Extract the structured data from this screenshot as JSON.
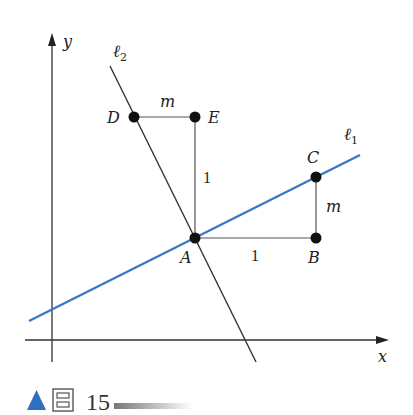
{
  "figure": {
    "caption": {
      "marker": "▲",
      "char": "图",
      "number": "15",
      "accent_color": "#2f6fc0"
    },
    "axes": {
      "x_label": "x",
      "y_label": "y",
      "color": "#333333"
    },
    "lines": [
      {
        "id": "l1",
        "label": "ℓ",
        "subscript": "1",
        "color": "#3a78c4",
        "description": "slope m"
      },
      {
        "id": "l2",
        "label": "ℓ",
        "subscript": "2",
        "color": "#333333",
        "description": "perpendicular, slope -1/m"
      }
    ],
    "points": [
      {
        "name": "A",
        "label": "A"
      },
      {
        "name": "B",
        "label": "B"
      },
      {
        "name": "C",
        "label": "C"
      },
      {
        "name": "D",
        "label": "D"
      },
      {
        "name": "E",
        "label": "E"
      }
    ],
    "segments": {
      "AB_label": "1",
      "BC_label": "m",
      "AE_label": "1",
      "DE_label": "m"
    }
  }
}
